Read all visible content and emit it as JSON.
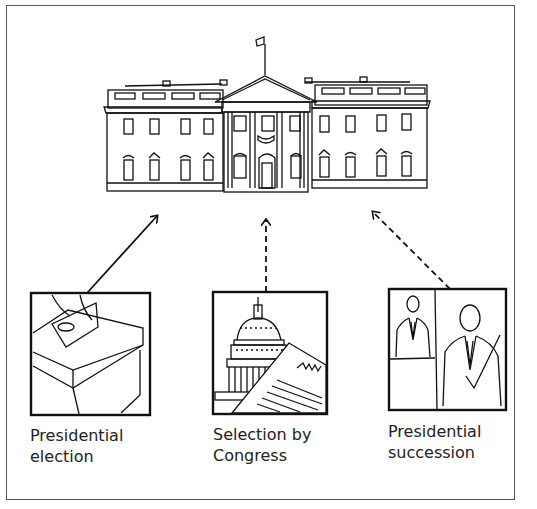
{
  "diagram": {
    "center": {
      "name": "White House",
      "icon": "white-house-icon"
    },
    "sources": [
      {
        "id": "election",
        "line1": "Presidential",
        "line2": "election",
        "icon": "ballot-box-icon",
        "arrow": "solid"
      },
      {
        "id": "congress",
        "line1": "Selection by",
        "line2": "Congress",
        "icon": "capitol-document-icon",
        "arrow": "dashed"
      },
      {
        "id": "succession",
        "line1": "Presidential",
        "line2": "succession",
        "icon": "successor-figures-icon",
        "arrow": "dashed"
      }
    ],
    "colors": {
      "line": "#111111",
      "background": "#ffffff",
      "text": "#222222"
    }
  }
}
